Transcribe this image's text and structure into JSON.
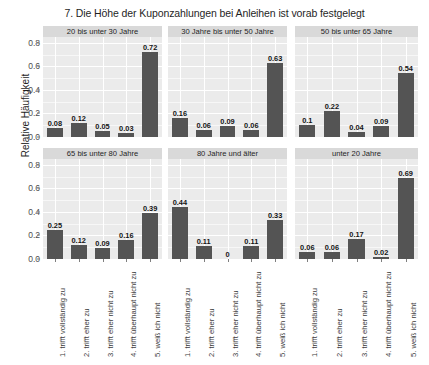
{
  "chart_data": {
    "type": "bar",
    "title": "7. Die Höhe der Kuponzahlungen bei Anleihen ist vorab festgelegt",
    "xlabel": "",
    "ylabel": "Relative Häufigkeit",
    "ylim": [
      0,
      0.85
    ],
    "yticks": [
      0.0,
      0.2,
      0.4,
      0.6,
      0.8
    ],
    "ytick_labels": [
      "0.0",
      "0.2",
      "0.4",
      "0.6",
      "0.8"
    ],
    "grid": true,
    "legend": "none",
    "facet_layout": {
      "rows": 2,
      "cols": 3
    },
    "categories": [
      "1. trifft vollständig zu",
      "2. trifft eher zu",
      "3. trifft eher nicht zu",
      "4. trifft überhaupt nicht zu",
      "5. weiß ich nicht"
    ],
    "bar_color": "#545454",
    "panel_bg": "#ebebeb",
    "strip_bg": "#d9d9d9",
    "panels": [
      {
        "facet": "20 bis unter 30 Jahre",
        "values": [
          0.08,
          0.12,
          0.05,
          0.03,
          0.72
        ],
        "labels": [
          "0.08",
          "0.12",
          "0.05",
          "0.03",
          "0.72"
        ]
      },
      {
        "facet": "30 Jahre bis unter 50 Jahre",
        "values": [
          0.16,
          0.06,
          0.09,
          0.06,
          0.63
        ],
        "labels": [
          "0.16",
          "0.06",
          "0.09",
          "0.06",
          "0.63"
        ]
      },
      {
        "facet": "50 bis unter 65 Jahre",
        "values": [
          0.1,
          0.22,
          0.04,
          0.09,
          0.54
        ],
        "labels": [
          "0.1",
          "0.22",
          "0.04",
          "0.09",
          "0.54"
        ]
      },
      {
        "facet": "65 bis unter 80 Jahre",
        "values": [
          0.25,
          0.12,
          0.09,
          0.16,
          0.39
        ],
        "labels": [
          "0.25",
          "0.12",
          "0.09",
          "0.16",
          "0.39"
        ]
      },
      {
        "facet": "80 Jahre und älter",
        "values": [
          0.44,
          0.11,
          0.0,
          0.11,
          0.33
        ],
        "labels": [
          "0.44",
          "0.11",
          "0",
          "0.11",
          "0.33"
        ]
      },
      {
        "facet": "unter 20 Jahre",
        "values": [
          0.06,
          0.06,
          0.17,
          0.02,
          0.69
        ],
        "labels": [
          "0.06",
          "0.06",
          "0.17",
          "0.02",
          "0.69"
        ]
      }
    ]
  }
}
